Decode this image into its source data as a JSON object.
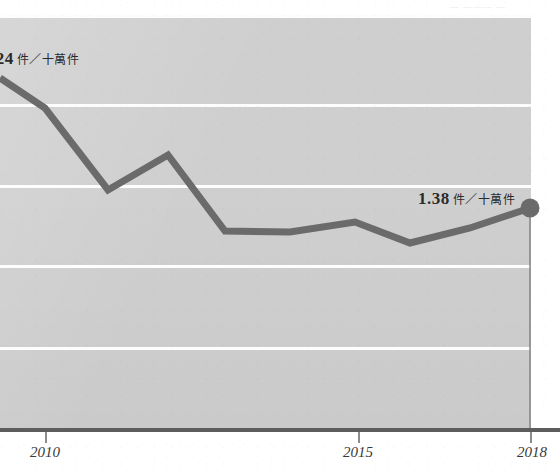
{
  "chart_data": {
    "type": "line",
    "title": "",
    "subtitle": "",
    "xlabel": "",
    "ylabel": "",
    "grid": "horizontal",
    "legend": "none",
    "unit_label": "件／十萬件",
    "x": [
      2009,
      2010,
      2011,
      2012,
      2013,
      2014,
      2015,
      2016,
      2017,
      2018
    ],
    "xlim": [
      2008.3,
      2018
    ],
    "ylim": [
      0.0,
      3.0
    ],
    "xticks": [
      2010,
      2015,
      2018
    ],
    "xticklabels": [
      "2010",
      "2015",
      "2018"
    ],
    "series": [
      {
        "name": "發生率",
        "color": "#6b6b6b",
        "values": [
          2.24,
          1.92,
          1.6,
          1.81,
          1.38,
          1.38,
          1.42,
          1.3,
          1.33,
          1.38
        ]
      }
    ],
    "annotations": [
      {
        "id": "start",
        "value_text": ".24",
        "unit_text": "件／十萬件",
        "note": "leading digit clipped at left edge of image"
      },
      {
        "id": "end",
        "value_text": "1.38",
        "unit_text": "件／十萬件",
        "marker": true
      }
    ],
    "gridline_y_px": [
      14,
      104,
      185,
      265,
      347
    ],
    "colors": {
      "panel": "#cfcfcf",
      "gridline": "#fdfdfd",
      "line": "#6b6b6b",
      "marker": "#6b6b6b",
      "axis": "#5d5d5d",
      "tick": "#8c8c8c",
      "text": "#2b2b2b",
      "axis_label": "#3a3a3a"
    },
    "line_points_px": [
      [
        0,
        78
      ],
      [
        45,
        108
      ],
      [
        108,
        190
      ],
      [
        168,
        155
      ],
      [
        225,
        231
      ],
      [
        290,
        232
      ],
      [
        355,
        222
      ],
      [
        410,
        243
      ],
      [
        470,
        228
      ],
      [
        530,
        208
      ]
    ],
    "marker_px": {
      "x": 530,
      "y": 208,
      "r": 9
    },
    "dropline_px": {
      "x": 530,
      "y_top": 216,
      "y_bottom": 430
    }
  },
  "axis": {
    "ticks": [
      {
        "label": "2010",
        "x_px": 45
      },
      {
        "label": "2015",
        "x_px": 358
      },
      {
        "label": "2018",
        "x_px": 530
      }
    ]
  },
  "top_remnant": {
    "text": "— ——— —"
  }
}
